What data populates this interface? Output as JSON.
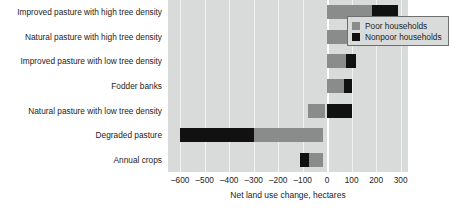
{
  "chart_data": {
    "type": "bar",
    "orientation": "horizontal",
    "stacked": true,
    "title": "",
    "xlabel": "Net land use change, hectares",
    "ylabel": "",
    "xlim": [
      -650,
      330
    ],
    "xticks": [
      -600,
      -500,
      -400,
      -300,
      -200,
      -100,
      0,
      100,
      200,
      300
    ],
    "xtick_labels": [
      "–600",
      "–500",
      "–400",
      "–300",
      "–200",
      "–100",
      "0",
      "100",
      "200",
      "300"
    ],
    "grid": true,
    "legend_position": "upper-left-inside",
    "categories": [
      "Improved pasture with high tree density",
      "Natural pasture with high tree density",
      "Improved pasture with low tree density",
      "Fodder banks",
      "Natural pasture with low tree density",
      "Degraded pasture",
      "Annual crops"
    ],
    "series": [
      {
        "name": "Poor households",
        "color": "#8a8c8c",
        "values": [
          185,
          88,
          75,
          70,
          -80,
          -280,
          -58
        ]
      },
      {
        "name": "Nonpoor households",
        "color": "#111111",
        "values": [
          105,
          32,
          43,
          30,
          103,
          -310,
          -35
        ]
      }
    ],
    "segments": [
      {
        "category": "Improved pasture with high tree density",
        "parts": [
          {
            "series": "Poor households",
            "start": 0,
            "end": 185
          },
          {
            "series": "Nonpoor households",
            "start": 185,
            "end": 290
          }
        ]
      },
      {
        "category": "Natural pasture with high tree density",
        "parts": [
          {
            "series": "Poor households",
            "start": 0,
            "end": 88
          },
          {
            "series": "Nonpoor households",
            "start": 88,
            "end": 120
          }
        ]
      },
      {
        "category": "Improved pasture with low tree density",
        "parts": [
          {
            "series": "Poor households",
            "start": 0,
            "end": 75
          },
          {
            "series": "Nonpoor households",
            "start": 75,
            "end": 118
          }
        ]
      },
      {
        "category": "Fodder banks",
        "parts": [
          {
            "series": "Poor households",
            "start": 0,
            "end": 70
          },
          {
            "series": "Nonpoor households",
            "start": 70,
            "end": 100
          }
        ]
      },
      {
        "category": "Natural pasture with low tree density",
        "parts": [
          {
            "series": "Poor households",
            "start": -80,
            "end": -8
          },
          {
            "series": "Nonpoor households",
            "start": 0,
            "end": 103
          }
        ]
      },
      {
        "category": "Degraded pasture",
        "parts": [
          {
            "series": "Nonpoor households",
            "start": -600,
            "end": -298
          },
          {
            "series": "Poor households",
            "start": -298,
            "end": -18
          }
        ]
      },
      {
        "category": "Annual crops",
        "parts": [
          {
            "series": "Nonpoor households",
            "start": -112,
            "end": -76
          },
          {
            "series": "Poor households",
            "start": -76,
            "end": -18
          }
        ]
      }
    ]
  },
  "legend": {
    "items": [
      {
        "label": "Poor households",
        "color": "#8a8c8c"
      },
      {
        "label": "Nonpoor households",
        "color": "#111111"
      }
    ]
  },
  "colors": {
    "plot_background": "#d9dada",
    "gridline": "#f2f2f2",
    "zero_line": "#ffffff",
    "poor": "#8a8c8c",
    "nonpoor": "#111111",
    "text": "#1d1d1d"
  }
}
